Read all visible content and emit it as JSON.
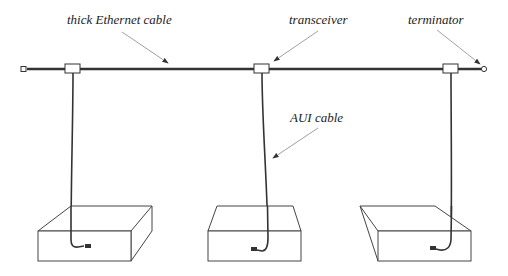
{
  "diagram": {
    "type": "network-topology",
    "labels": {
      "cable": "thick Ethernet cable",
      "transceiver": "transceiver",
      "terminator": "terminator",
      "aui": "AUI cable"
    },
    "components": {
      "backbone": "thick Ethernet cable",
      "terminators": 2,
      "transceivers": 3,
      "stations": 3
    },
    "colors": {
      "line": "#333333",
      "arrow": "#888888",
      "text": "#222222"
    }
  }
}
